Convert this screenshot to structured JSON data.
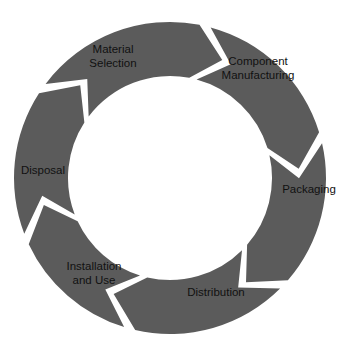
{
  "diagram": {
    "type": "cycle",
    "center": [
      170,
      178
    ],
    "outer_radius": 156,
    "inner_radius": 102,
    "notch_depth": 13,
    "gap": 4.2,
    "segment_color": "#5b5b5b",
    "background_color": "#ffffff",
    "text_color": "#111111",
    "steps": [
      {
        "id": "material-selection",
        "lines": [
          "Material",
          "Selection"
        ],
        "start_deg": 305,
        "end_deg": 13,
        "label_pos": [
          113,
          56
        ]
      },
      {
        "id": "component-manufacturing",
        "lines": [
          "Component",
          "Manufacturing"
        ],
        "start_deg": 13,
        "end_deg": 75,
        "label_pos": [
          258,
          68
        ]
      },
      {
        "id": "packaging",
        "lines": [
          "Packaging"
        ],
        "start_deg": 75,
        "end_deg": 133,
        "label_pos": [
          309,
          189
        ]
      },
      {
        "id": "distribution",
        "lines": [
          "Distribution"
        ],
        "start_deg": 133,
        "end_deg": 195,
        "label_pos": [
          216,
          292
        ]
      },
      {
        "id": "installation-and-use",
        "lines": [
          "Installation",
          "and Use"
        ],
        "start_deg": 195,
        "end_deg": 247,
        "label_pos": [
          94,
          273
        ]
      },
      {
        "id": "disposal",
        "lines": [
          "Disposal"
        ],
        "start_deg": 247,
        "end_deg": 305,
        "label_pos": [
          43,
          170
        ]
      }
    ]
  }
}
